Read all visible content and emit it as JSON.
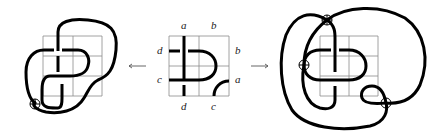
{
  "figure": {
    "left_panel": {
      "name": "virtual knot diagram (closure with one virtual crossing)",
      "virtual_crossings": 1
    },
    "middle_panel": {
      "name": "tile with labeled endpoints",
      "labels": {
        "top": [
          "a",
          "b"
        ],
        "left": [
          "d",
          "c"
        ],
        "right": [
          "b",
          "a"
        ],
        "bottom": [
          "d",
          "c"
        ]
      }
    },
    "right_panel": {
      "name": "virtual knot diagram (alternate closure with three virtual crossings)",
      "virtual_crossings": 3
    },
    "arrows": {
      "left": "←",
      "right": "→"
    },
    "colors": {
      "strand": "#000000",
      "grid": "#8a8a8a",
      "label": "#222222"
    }
  }
}
